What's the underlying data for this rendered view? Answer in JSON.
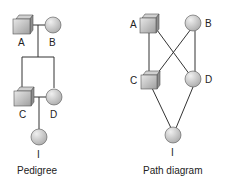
{
  "pedigree": {
    "caption": "Pedigree",
    "nodes": [
      {
        "id": "A",
        "label": "A",
        "shape": "square"
      },
      {
        "id": "B",
        "label": "B",
        "shape": "circle"
      },
      {
        "id": "C",
        "label": "C",
        "shape": "square"
      },
      {
        "id": "D",
        "label": "D",
        "shape": "circle"
      },
      {
        "id": "I",
        "label": "I",
        "shape": "circle"
      }
    ]
  },
  "path_diagram": {
    "caption": "Path diagram",
    "nodes": [
      {
        "id": "A",
        "label": "A",
        "shape": "square"
      },
      {
        "id": "B",
        "label": "B",
        "shape": "circle"
      },
      {
        "id": "C",
        "label": "C",
        "shape": "square"
      },
      {
        "id": "D",
        "label": "D",
        "shape": "circle"
      },
      {
        "id": "I",
        "label": "I",
        "shape": "circle"
      }
    ],
    "edges": [
      [
        "A",
        "C"
      ],
      [
        "A",
        "D"
      ],
      [
        "B",
        "C"
      ],
      [
        "B",
        "D"
      ],
      [
        "C",
        "I"
      ],
      [
        "D",
        "I"
      ]
    ]
  },
  "colors": {
    "line": "#333333",
    "fill_light": "#e6e6e6",
    "fill_dark": "#a8a8a8",
    "stroke": "#555555"
  }
}
